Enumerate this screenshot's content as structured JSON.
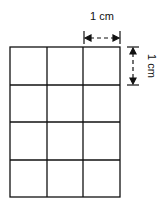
{
  "diagram": {
    "type": "grid",
    "rows": 4,
    "columns": 3,
    "cell_size_label": "1 cm",
    "line_color": "#111111",
    "background": "#ffffff"
  },
  "labels": {
    "horizontal_dimension": "1 cm",
    "vertical_dimension": "1 cm"
  }
}
